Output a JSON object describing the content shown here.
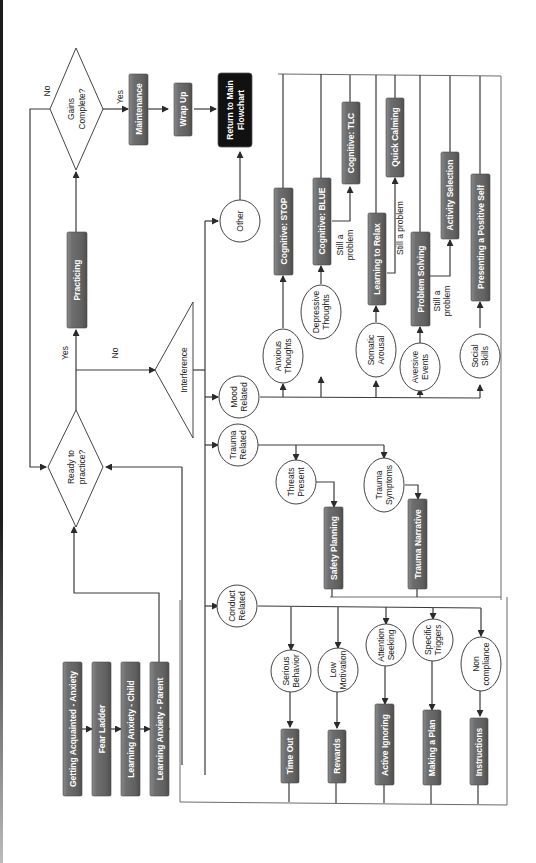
{
  "diagram": {
    "orientation": "rotated-90-ccw",
    "colors": {
      "process_box": "#6b6b6b",
      "terminal_box": "#111111",
      "node_fill": "#ffffff",
      "line": "#3a3a3a",
      "background": "#ffffff"
    },
    "intro_steps": [
      {
        "label": "Getting Acquainted - Anxiety"
      },
      {
        "label": "Fear Ladder"
      },
      {
        "label": "Learning Anxiety - Child"
      },
      {
        "label": "Learning Anxiety - Parent"
      }
    ],
    "decisions": {
      "ready": {
        "label_1": "Ready to",
        "label_2": "practice?"
      },
      "gains": {
        "label_1": "Gains",
        "label_2": "Complete?"
      }
    },
    "edge_labels": {
      "ready_yes": "Yes",
      "ready_no": "No",
      "gains_yes": "Yes",
      "gains_no": "No",
      "still_problem_blue_1": "Still a",
      "still_problem_blue_2": "problem",
      "still_problem_relax": "Still a problem",
      "still_problem_ps_1": "Still a",
      "still_problem_ps_2": "problem"
    },
    "main_steps": {
      "practicing": "Practicing",
      "maintenance": "Maintenance",
      "wrap_up": "Wrap Up",
      "return": {
        "line_1": "Return to Main",
        "line_2": "Flowchart"
      }
    },
    "interference": {
      "label": "Interference"
    },
    "categories": {
      "other": {
        "label": "Other"
      },
      "mood": {
        "line_1": "Mood",
        "line_2": "Related"
      },
      "trauma": {
        "line_1": "Trauma",
        "line_2": "Related"
      },
      "conduct": {
        "line_1": "Conduct",
        "line_2": "Related"
      }
    },
    "mood_problems": [
      {
        "line_1": "Anxious",
        "line_2": "Thoughts",
        "module": "Cognitive: STOP"
      },
      {
        "line_1": "Depressive",
        "line_2": "Thoughts",
        "module": "Cognitive: BLUE",
        "followup": "Cognitive: TLC"
      },
      {
        "line_1": "Somatic",
        "line_2": "Arousal",
        "module": "Learning to Relax",
        "followup": "Quick Calming"
      },
      {
        "line_1": "Aversive",
        "line_2": "Events",
        "module": "Problem Solving",
        "followup": "Activity Selection"
      },
      {
        "line_1": "Social",
        "line_2": "Skills",
        "module": "Presenting a Positive Self"
      }
    ],
    "trauma_problems": [
      {
        "line_1": "Threats",
        "line_2": "Present",
        "module": "Safety Planning"
      },
      {
        "line_1": "Trauma",
        "line_2": "Symptoms",
        "module": "Trauma Narrative"
      }
    ],
    "conduct_problems": [
      {
        "line_1": "Serious",
        "line_2": "Behavior",
        "module": "Time Out"
      },
      {
        "line_1": "Low",
        "line_2": "Motivation",
        "module": "Rewards"
      },
      {
        "line_1": "Attention",
        "line_2": "Seeking",
        "module": "Active Ignoring"
      },
      {
        "line_1": "Specific",
        "line_2": "Triggers",
        "module": "Making a Plan"
      },
      {
        "line_1": "Non",
        "line_2": "compliance",
        "module": "Instructions"
      }
    ]
  }
}
